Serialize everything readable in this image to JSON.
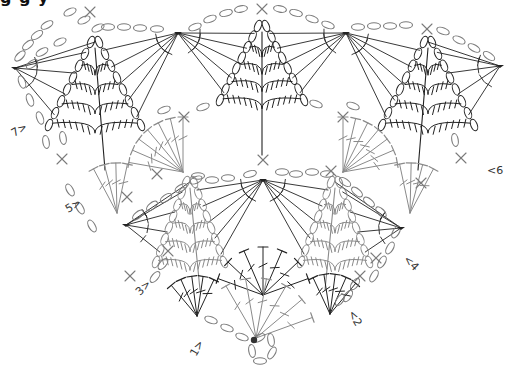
{
  "title_cut": "g g y",
  "colors": {
    "chain": "#7a7a7a",
    "light_stitch": "#8a8a8a",
    "dark_stitch": "#222222",
    "start_dot": "#333333",
    "background": "#ffffff"
  },
  "legend_row_labels": [
    {
      "text": "1>",
      "x": 196,
      "y": 357,
      "rot": -60
    },
    {
      "text": "<2",
      "x": 348,
      "y": 313,
      "rot": 60
    },
    {
      "text": "3>",
      "x": 140,
      "y": 296,
      "rot": -45
    },
    {
      "text": "<4",
      "x": 403,
      "y": 260,
      "rot": 45
    },
    {
      "text": "5>",
      "x": 68,
      "y": 213,
      "rot": -30
    },
    {
      "text": "<6",
      "x": 487,
      "y": 174,
      "rot": 0
    },
    {
      "text": "7>",
      "x": 14,
      "y": 137,
      "rot": -30
    }
  ],
  "chain_ovals": [
    {
      "x": 70,
      "y": 12,
      "a": -25
    },
    {
      "x": 84,
      "y": 20,
      "a": -25
    },
    {
      "x": 98,
      "y": 28,
      "a": -25
    },
    {
      "x": 47,
      "y": 25,
      "a": -30
    },
    {
      "x": 37,
      "y": 35,
      "a": -35
    },
    {
      "x": 28,
      "y": 45,
      "a": -40
    },
    {
      "x": 20,
      "y": 56,
      "a": -45
    },
    {
      "x": 60,
      "y": 42,
      "a": -25
    },
    {
      "x": 42,
      "y": 52,
      "a": -30
    },
    {
      "x": 32,
      "y": 64,
      "a": -35
    },
    {
      "x": 22,
      "y": 82,
      "a": 70
    },
    {
      "x": 30,
      "y": 100,
      "a": 70
    },
    {
      "x": 40,
      "y": 118,
      "a": 70
    },
    {
      "x": 46,
      "y": 142,
      "a": 80
    },
    {
      "x": 63,
      "y": 138,
      "a": 80
    },
    {
      "x": 108,
      "y": 27,
      "a": 0
    },
    {
      "x": 124,
      "y": 27,
      "a": 0
    },
    {
      "x": 140,
      "y": 28,
      "a": 0
    },
    {
      "x": 157,
      "y": 29,
      "a": 0
    },
    {
      "x": 195,
      "y": 27,
      "a": -20
    },
    {
      "x": 210,
      "y": 19,
      "a": -20
    },
    {
      "x": 226,
      "y": 13,
      "a": -15
    },
    {
      "x": 241,
      "y": 9,
      "a": -10
    },
    {
      "x": 280,
      "y": 9,
      "a": 10
    },
    {
      "x": 296,
      "y": 13,
      "a": 15
    },
    {
      "x": 312,
      "y": 19,
      "a": 20
    },
    {
      "x": 328,
      "y": 25,
      "a": 20
    },
    {
      "x": 358,
      "y": 27,
      "a": 0
    },
    {
      "x": 374,
      "y": 26,
      "a": 0
    },
    {
      "x": 390,
      "y": 26,
      "a": 0
    },
    {
      "x": 406,
      "y": 25,
      "a": 0
    },
    {
      "x": 443,
      "y": 31,
      "a": 20
    },
    {
      "x": 459,
      "y": 40,
      "a": 25
    },
    {
      "x": 474,
      "y": 48,
      "a": 30
    },
    {
      "x": 489,
      "y": 56,
      "a": 35
    },
    {
      "x": 164,
      "y": 110,
      "a": -20
    },
    {
      "x": 203,
      "y": 107,
      "a": -20
    },
    {
      "x": 316,
      "y": 104,
      "a": 20
    },
    {
      "x": 353,
      "y": 106,
      "a": 20
    },
    {
      "x": 455,
      "y": 140,
      "a": 80
    },
    {
      "x": 250,
      "y": 174,
      "a": -15
    },
    {
      "x": 228,
      "y": 178,
      "a": 0
    },
    {
      "x": 212,
      "y": 180,
      "a": 0
    },
    {
      "x": 198,
      "y": 176,
      "a": 0
    },
    {
      "x": 282,
      "y": 172,
      "a": 0
    },
    {
      "x": 296,
      "y": 174,
      "a": 0
    },
    {
      "x": 312,
      "y": 172,
      "a": 0
    },
    {
      "x": 327,
      "y": 174,
      "a": 0
    },
    {
      "x": 196,
      "y": 180,
      "a": -25
    },
    {
      "x": 181,
      "y": 188,
      "a": -30
    },
    {
      "x": 166,
      "y": 198,
      "a": -35
    },
    {
      "x": 152,
      "y": 206,
      "a": -40
    },
    {
      "x": 138,
      "y": 215,
      "a": -40
    },
    {
      "x": 70,
      "y": 190,
      "a": 60
    },
    {
      "x": 80,
      "y": 208,
      "a": 60
    },
    {
      "x": 92,
      "y": 226,
      "a": 60
    },
    {
      "x": 345,
      "y": 182,
      "a": 35
    },
    {
      "x": 357,
      "y": 192,
      "a": 40
    },
    {
      "x": 369,
      "y": 202,
      "a": 40
    },
    {
      "x": 381,
      "y": 212,
      "a": 45
    },
    {
      "x": 396,
      "y": 232,
      "a": -60
    },
    {
      "x": 390,
      "y": 248,
      "a": -60
    },
    {
      "x": 382,
      "y": 262,
      "a": -60
    },
    {
      "x": 374,
      "y": 276,
      "a": -60
    },
    {
      "x": 155,
      "y": 277,
      "a": -50
    },
    {
      "x": 163,
      "y": 264,
      "a": -50
    },
    {
      "x": 211,
      "y": 320,
      "a": 20
    },
    {
      "x": 227,
      "y": 328,
      "a": 20
    },
    {
      "x": 242,
      "y": 337,
      "a": 20
    },
    {
      "x": 259,
      "y": 338,
      "a": -30
    },
    {
      "x": 252,
      "y": 351,
      "a": 80
    },
    {
      "x": 260,
      "y": 361,
      "a": 0
    },
    {
      "x": 272,
      "y": 353,
      "a": -60
    },
    {
      "x": 271,
      "y": 340,
      "a": 80
    },
    {
      "x": 355,
      "y": 284,
      "a": -55
    },
    {
      "x": 348,
      "y": 296,
      "a": -55
    },
    {
      "x": 340,
      "y": 300,
      "a": -55
    }
  ],
  "sc_marks": [
    {
      "x": 90,
      "y": 12
    },
    {
      "x": 262,
      "y": 9
    },
    {
      "x": 427,
      "y": 29
    },
    {
      "x": 184,
      "y": 117
    },
    {
      "x": 343,
      "y": 117
    },
    {
      "x": 263,
      "y": 160
    },
    {
      "x": 62,
      "y": 159
    },
    {
      "x": 127,
      "y": 197
    },
    {
      "x": 157,
      "y": 174
    },
    {
      "x": 331,
      "y": 171
    },
    {
      "x": 461,
      "y": 158
    },
    {
      "x": 421,
      "y": 183
    },
    {
      "x": 168,
      "y": 251
    },
    {
      "x": 376,
      "y": 258
    },
    {
      "x": 360,
      "y": 276
    },
    {
      "x": 130,
      "y": 276
    }
  ],
  "hubs_dark": [
    {
      "id": "top-left",
      "x": 15,
      "y": 68
    },
    {
      "id": "top-mid-left",
      "x": 178,
      "y": 33
    },
    {
      "id": "top-mid-right",
      "x": 346,
      "y": 33
    },
    {
      "id": "top-right",
      "x": 500,
      "y": 66
    },
    {
      "id": "center",
      "x": 263,
      "y": 180
    },
    {
      "id": "mid-left",
      "x": 126,
      "y": 225
    },
    {
      "id": "mid-right",
      "x": 401,
      "y": 228
    }
  ],
  "start_dot": {
    "x": 254,
    "y": 340
  },
  "pineapples": [
    {
      "id": "pine-top-left",
      "apex_x": 95,
      "apex_y": 42,
      "base_y": 125,
      "half_w": 42,
      "stem_y": 170,
      "tone": "dark"
    },
    {
      "id": "pine-top-center",
      "apex_x": 262,
      "apex_y": 26,
      "base_y": 100,
      "half_w": 38,
      "stem_y": 155,
      "tone": "dark"
    },
    {
      "id": "pine-top-right",
      "apex_x": 428,
      "apex_y": 42,
      "base_y": 125,
      "half_w": 42,
      "stem_y": 170,
      "tone": "dark"
    },
    {
      "id": "pine-mid-left",
      "apex_x": 190,
      "apex_y": 182,
      "base_y": 262,
      "half_w": 30,
      "stem_y": 290,
      "tone": "light"
    },
    {
      "id": "pine-mid-right",
      "apex_x": 335,
      "apex_y": 182,
      "base_y": 262,
      "half_w": 30,
      "stem_y": 290,
      "tone": "light"
    }
  ],
  "fans": [
    {
      "id": "fan-row6-left",
      "cx": 183,
      "cy": 172,
      "r": 55,
      "start": -170,
      "end": -90,
      "n": 7,
      "tone": "light"
    },
    {
      "id": "fan-row6-right",
      "cx": 343,
      "cy": 172,
      "r": 55,
      "start": -90,
      "end": -10,
      "n": 7,
      "tone": "light"
    },
    {
      "id": "fan-row5-left",
      "cx": 117,
      "cy": 213,
      "r": 50,
      "start": -118,
      "end": -78,
      "n": 4,
      "tone": "light"
    },
    {
      "id": "fan-row5-right",
      "cx": 410,
      "cy": 213,
      "r": 50,
      "start": -102,
      "end": -62,
      "n": 4,
      "tone": "light"
    },
    {
      "id": "fan-row2-left",
      "cx": 197,
      "cy": 316,
      "r": 40,
      "start": -130,
      "end": -65,
      "n": 5,
      "tone": "dark"
    },
    {
      "id": "fan-row2-right",
      "cx": 330,
      "cy": 314,
      "r": 40,
      "start": -115,
      "end": -50,
      "n": 5,
      "tone": "dark"
    },
    {
      "id": "fan-row3-center",
      "cx": 263,
      "cy": 295,
      "r": 48,
      "start": -160,
      "end": -20,
      "n": 7,
      "tone": "dark"
    },
    {
      "id": "fan-row1-center",
      "cx": 256,
      "cy": 338,
      "r": 60,
      "start": -120,
      "end": -20,
      "n": 6,
      "tone": "light"
    }
  ]
}
